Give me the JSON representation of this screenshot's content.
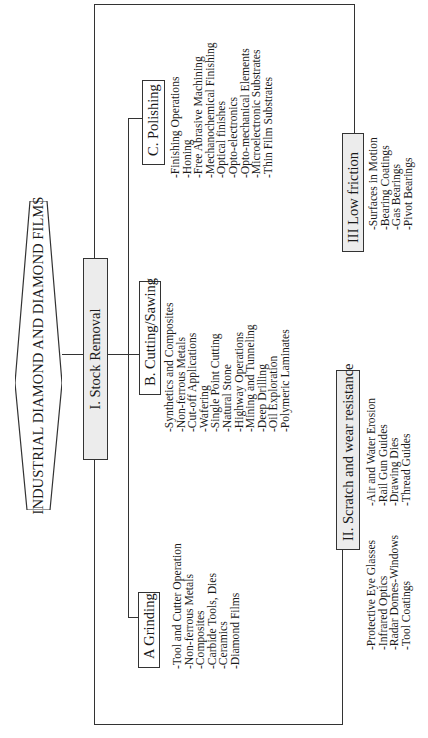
{
  "title": "INDUSTRIAL DIAMOND AND DIAMOND FILMS",
  "categories": [
    {
      "id": "stock_removal",
      "label": "I.  Stock Removal",
      "subcategories": [
        {
          "id": "grinding",
          "label": "A  Grinding",
          "items": [
            "-Tool and Cutter Operation",
            "-Non-ferrous Metals",
            "-Composites",
            "-Carbide Tools, Dies",
            "-Ceramics",
            "-Diamond Films"
          ]
        },
        {
          "id": "cutting_sawing",
          "label": "B.  Cutting/Sawing",
          "items": [
            "-Synthetics and Composites",
            "-Non-ferrous Metals",
            "-Cut-off Applications",
            "-Wafering",
            "-Single Point Cutting",
            "-Natural Stone",
            "-Highway Operations",
            "-Mining and Tunneling",
            "-Deep Drilling",
            "-Oil Exploration",
            "-Polymeric Laminates"
          ]
        },
        {
          "id": "polishing",
          "label": "C. Polishing",
          "items": [
            "-Finishing Operations",
            "-Honing",
            "-Free Abrasive Machining",
            "-Mechanochemical Finishing",
            "-Optical finishes",
            "-Opto-electronics",
            "-Opto-mechanical Elements",
            "-Microelectronic Substrates",
            "-Thin Film Substrates"
          ]
        }
      ]
    },
    {
      "id": "scratch_wear",
      "label": "II.  Scratch and wear resistance",
      "items_col1": [
        "-Protective Eye Glasses",
        "-Infrared Optics",
        "-Radar Domes-Windows",
        "-Tool Coatings"
      ],
      "items_col2": [
        "-Air and Water Erosion",
        "-Rail Gun Guides",
        "-Drawing Dies",
        "-Thread Guides"
      ]
    },
    {
      "id": "low_friction",
      "label": "III  Low friction",
      "items": [
        "-Surfaces in Motion",
        "-Bearing Coatings",
        "-Gas Bearings",
        "-Pivot Bearings"
      ]
    }
  ],
  "colors": {
    "line": "#333333",
    "shaded_box": "#ececec",
    "text": "#1a1a1a",
    "background": "#ffffff"
  },
  "orientation": "rotated -90deg (text reads bottom-to-top)"
}
